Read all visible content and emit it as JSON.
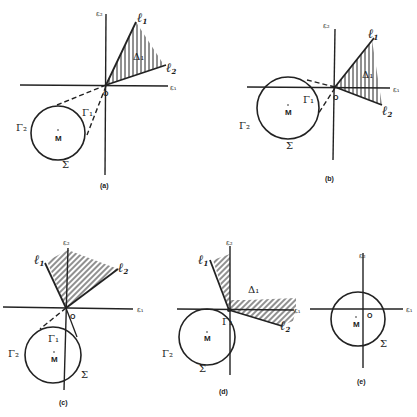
{
  "figure": {
    "axis_labels": {
      "x": "ε₁",
      "y": "ε₂",
      "origin": "O"
    },
    "symbols": {
      "circle": "Σ",
      "center": "M",
      "arc1": "Γ₁",
      "arc2": "Γ₂",
      "line1": "ℓ",
      "line1_sub": "1",
      "line2": "ℓ",
      "line2_sub": "2",
      "region": "Δ₁"
    },
    "panels": [
      {
        "id": "a",
        "caption": "(a)"
      },
      {
        "id": "b",
        "caption": "(b)"
      },
      {
        "id": "c",
        "caption": "(c)"
      },
      {
        "id": "d",
        "caption": "(d)"
      },
      {
        "id": "e",
        "caption": "(e)"
      }
    ]
  }
}
